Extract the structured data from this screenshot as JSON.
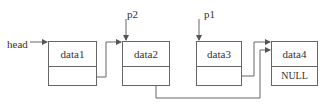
{
  "diagram": {
    "type": "singly-linked-list",
    "head_label": "head",
    "pointers": [
      {
        "label": "p2",
        "points_to": "data2"
      },
      {
        "label": "p1",
        "points_to": "data3"
      }
    ],
    "nodes": [
      {
        "data": "data1",
        "next": ""
      },
      {
        "data": "data2",
        "next": ""
      },
      {
        "data": "data3",
        "next": ""
      },
      {
        "data": "data4",
        "next": "NULL"
      }
    ],
    "edges": [
      {
        "from": "head",
        "to": "data1"
      },
      {
        "from": "data1",
        "to": "data2"
      },
      {
        "from": "data2",
        "to": "data4"
      },
      {
        "from": "data3",
        "to": "data4"
      }
    ],
    "colors": {
      "line": "#666666",
      "text": "#333333",
      "background": "#ffffff"
    }
  }
}
